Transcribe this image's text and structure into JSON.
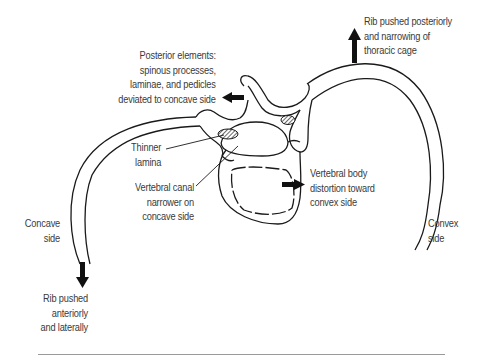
{
  "diagram": {
    "labels": {
      "posterior_elements": [
        "Posterior elements:",
        "spinous processes,",
        "laminae, and pedicles",
        "deviated to concave side"
      ],
      "rib_posterior": [
        "Rib pushed posteriorly",
        "and narrowing of",
        "thoracic cage"
      ],
      "thinner_lamina": [
        "Thinner",
        "lamina"
      ],
      "vertebral_canal": [
        "Vertebral canal",
        "narrower on",
        "concave side"
      ],
      "vertebral_body": [
        "Vertebral body",
        "distortion toward",
        "convex side"
      ],
      "concave_side": [
        "Concave",
        "side"
      ],
      "convex_side": [
        "Convex",
        "side"
      ],
      "rib_anterior": [
        "Rib pushed",
        "anteriorly",
        "and laterally"
      ]
    },
    "colors": {
      "line": "#1a1a1a",
      "text": "#3a3a3a",
      "hatch": "#555555",
      "rule": "#9a9a9a"
    }
  }
}
